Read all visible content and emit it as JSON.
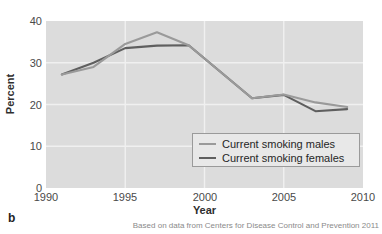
{
  "panel": {
    "letter": "b"
  },
  "source_note": "Based on data from Centers for Disease Control and Prevention 2011",
  "axes": {
    "xlabel": "Year",
    "ylabel": "Percent",
    "yticks": [
      "0",
      "10",
      "20",
      "30",
      "40"
    ],
    "xticks": [
      "1990",
      "1995",
      "2000",
      "2005",
      "2010"
    ]
  },
  "legend": {
    "items": [
      {
        "label": "Current smoking males",
        "color": "#9a9a9a"
      },
      {
        "label": "Current smoking females",
        "color": "#5f5f5f"
      }
    ]
  },
  "colors": {
    "plot_background": "#dcdcdc",
    "gridline": "#f0f0f0",
    "males_line": "#9a9a9a",
    "females_line": "#5f5f5f",
    "legend_background": "#e8e8e8",
    "legend_border": "#9a9a9a"
  },
  "chart_data": {
    "type": "line",
    "title": "",
    "xlabel": "Year",
    "ylabel": "Percent",
    "xlim": [
      1990,
      2010
    ],
    "ylim": [
      0,
      40
    ],
    "xticks": [
      1990,
      1995,
      2000,
      2005,
      2010
    ],
    "yticks": [
      0,
      10,
      20,
      30,
      40
    ],
    "grid": true,
    "legend_position": "lower right",
    "x": [
      1991,
      1993,
      1995,
      1997,
      1999,
      2003,
      2005,
      2007,
      2009
    ],
    "series": [
      {
        "name": "Current smoking males",
        "color": "#9a9a9a",
        "values": [
          27.2,
          29.0,
          34.5,
          37.3,
          34.2,
          21.5,
          22.4,
          20.5,
          19.4
        ]
      },
      {
        "name": "Current smoking females",
        "color": "#5f5f5f",
        "values": [
          27.2,
          30.0,
          33.5,
          34.1,
          34.2,
          21.5,
          22.3,
          18.4,
          18.9
        ]
      }
    ],
    "annotations": [
      "Based on data from Centers for Disease Control and Prevention 2011"
    ]
  }
}
